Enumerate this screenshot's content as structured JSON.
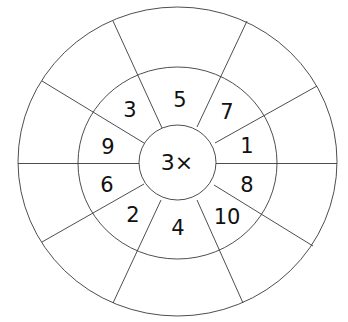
{
  "diagram": {
    "type": "multiplication-wheel",
    "center_label": "3×",
    "multiplier": 3,
    "inner_ring_numbers": [
      {
        "value": "5",
        "position": "top"
      },
      {
        "value": "7",
        "position": "top-right"
      },
      {
        "value": "1",
        "position": "right-upper"
      },
      {
        "value": "8",
        "position": "right-lower"
      },
      {
        "value": "10",
        "position": "bottom-right"
      },
      {
        "value": "4",
        "position": "bottom"
      },
      {
        "value": "2",
        "position": "bottom-left"
      },
      {
        "value": "6",
        "position": "left-lower"
      },
      {
        "value": "9",
        "position": "left-upper"
      },
      {
        "value": "3",
        "position": "top-left"
      }
    ],
    "outer_ring_answers": [
      "",
      "",
      "",
      "",
      "",
      "",
      "",
      "",
      "",
      ""
    ],
    "line_color": "#3a3a3a",
    "text_color": "#111111",
    "background": "#ffffff"
  }
}
